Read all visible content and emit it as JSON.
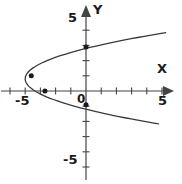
{
  "figure": {
    "background_color": "#ffffff",
    "stroke_color": "#3a3a3a",
    "axis_color": "#444444",
    "point_color": "#1a1a1a",
    "width": 182,
    "height": 184
  },
  "labels": {
    "x_axis_name": "X",
    "y_axis_name": "Y",
    "x_neg_five": "-5",
    "x_pos_five": "5",
    "y_pos_five": "5",
    "y_neg_five": "-5",
    "origin": "0"
  },
  "chart_data": {
    "type": "line",
    "title": "",
    "xlabel": "X",
    "ylabel": "Y",
    "xlim": [
      -5.8,
      5.8
    ],
    "ylim": [
      -6.2,
      6.2
    ],
    "xticks": [
      -5,
      -4,
      -3,
      -2,
      -1,
      1,
      2,
      3,
      4,
      5
    ],
    "yticks": [
      -5,
      -4,
      -3,
      -2,
      -1,
      1,
      2,
      3,
      4,
      5
    ],
    "xtick_labels": {
      "-5": "-5",
      "5": "5"
    },
    "ytick_labels": {
      "5": "5",
      "-5": "-5"
    },
    "grid": false,
    "legend": null,
    "origin_label": "0",
    "curve": {
      "name": "sideways parabola opening right",
      "equation": "x = (y - 0.8)^2 - 4",
      "vertex": [
        -4.0,
        0.8
      ],
      "points_x": [
        -4.0,
        -3.9,
        -3.7,
        -3.4,
        -3.0,
        -2.5,
        -1.9,
        -1.2,
        -0.4,
        0.5,
        1.5,
        2.6,
        3.8,
        5.1
      ],
      "points_y_upper": [
        0.8,
        1.1,
        1.35,
        1.57,
        1.8,
        2.03,
        2.25,
        2.48,
        2.7,
        2.92,
        3.15,
        3.38,
        3.6,
        3.83
      ],
      "points_y_lower": [
        0.8,
        0.5,
        0.25,
        0.03,
        -0.2,
        -0.43,
        -0.65,
        -0.88,
        -1.1,
        -1.32,
        -1.55,
        -1.78,
        -2.0,
        -2.23
      ]
    },
    "marked_points": [
      {
        "x": -3.6,
        "y": 1.0
      },
      {
        "x": -2.7,
        "y": 0.0
      },
      {
        "x": 0.0,
        "y": 2.9
      },
      {
        "x": 0.0,
        "y": -0.9
      }
    ]
  }
}
